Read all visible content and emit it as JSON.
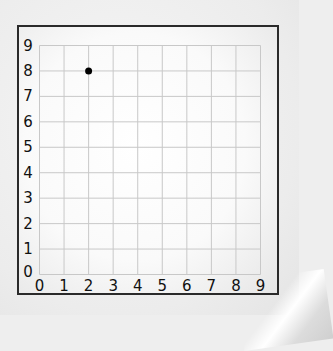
{
  "chart_data": {
    "type": "scatter",
    "title": "",
    "xlabel": "",
    "ylabel": "",
    "xlim": [
      0,
      9
    ],
    "ylim": [
      0,
      9
    ],
    "grid": true,
    "x_ticks": [
      "0",
      "1",
      "2",
      "3",
      "4",
      "5",
      "6",
      "7",
      "8",
      "9"
    ],
    "y_ticks": [
      "0",
      "1",
      "2",
      "3",
      "4",
      "5",
      "6",
      "7",
      "8",
      "9"
    ],
    "points": [
      {
        "x": 2,
        "y": 8
      }
    ],
    "colors": {
      "point": "#000000",
      "grid": "#c8c8c8",
      "frame": "#2a2a2a"
    }
  }
}
